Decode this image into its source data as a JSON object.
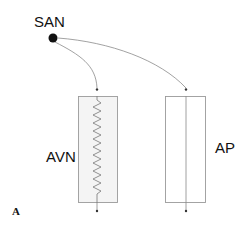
{
  "diagram": {
    "labels": {
      "san": "SAN",
      "avn": "AVN",
      "ap": "AP",
      "panel": "A"
    },
    "colors": {
      "stroke": "#9a9a9a",
      "box_fill": "#f4f4f4",
      "box_fill_ap": "#ffffff",
      "node": "#111111",
      "arrow": "#777777"
    },
    "nodes": [
      {
        "id": "SAN",
        "type": "source-node"
      },
      {
        "id": "AVN",
        "type": "slow-conduction-pathway",
        "symbol": "zigzag-resistor"
      },
      {
        "id": "AP",
        "type": "accessory-pathway",
        "symbol": "straight-line"
      }
    ],
    "edges": [
      {
        "from": "SAN",
        "to": "AVN"
      },
      {
        "from": "SAN",
        "to": "AP"
      }
    ]
  }
}
